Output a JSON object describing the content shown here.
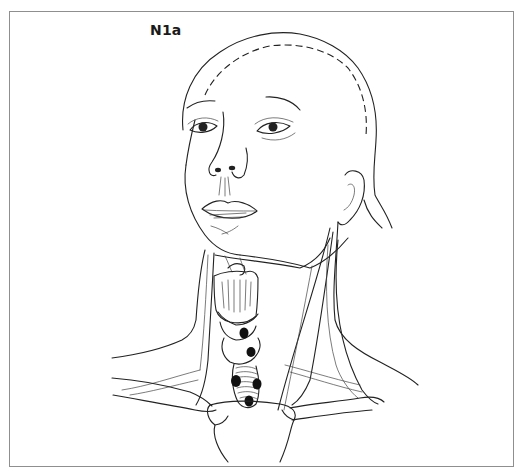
{
  "figure": {
    "label": "N1a",
    "structures": [
      "face",
      "ear",
      "larynx",
      "thyroid",
      "trachea",
      "neck-muscles",
      "clavicles",
      "sternum"
    ],
    "lymph_nodes": [
      {
        "id": "node-1",
        "x": 244,
        "y": 333
      },
      {
        "id": "node-2",
        "x": 251,
        "y": 352
      },
      {
        "id": "node-3",
        "x": 236,
        "y": 381
      },
      {
        "id": "node-4",
        "x": 257,
        "y": 384
      },
      {
        "id": "node-5",
        "x": 249,
        "y": 401
      }
    ],
    "colors": {
      "frame": "#8f8f8f",
      "line": "#222222",
      "node": "#111111",
      "background": "#ffffff"
    }
  }
}
